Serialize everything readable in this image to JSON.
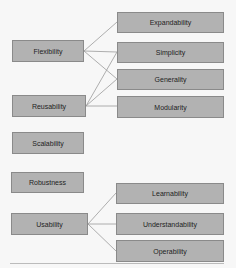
{
  "diagram": {
    "colors": {
      "box_fill": "#b2b2b2",
      "box_border": "#8a8a8a",
      "line": "#9a9a9a",
      "background": "#f7f7f7"
    },
    "left_nodes": [
      {
        "id": "flexibility",
        "label": "Flexibility"
      },
      {
        "id": "reusability",
        "label": "Reusability"
      },
      {
        "id": "scalability",
        "label": "Scalability"
      },
      {
        "id": "robustness",
        "label": "Robustness"
      },
      {
        "id": "usability",
        "label": "Usability"
      }
    ],
    "right_nodes": [
      {
        "id": "expandability",
        "label": "Expandability"
      },
      {
        "id": "simplicity",
        "label": "Simplicity"
      },
      {
        "id": "generality",
        "label": "Generality"
      },
      {
        "id": "modularity",
        "label": "Modularity"
      },
      {
        "id": "learnability",
        "label": "Learnability"
      },
      {
        "id": "understandability",
        "label": "Understandability"
      },
      {
        "id": "operability",
        "label": "Operability"
      }
    ],
    "edges": [
      [
        "Flexibility",
        "Expandability"
      ],
      [
        "Flexibility",
        "Simplicity"
      ],
      [
        "Flexibility",
        "Generality"
      ],
      [
        "Reusability",
        "Simplicity"
      ],
      [
        "Reusability",
        "Generality"
      ],
      [
        "Reusability",
        "Modularity"
      ],
      [
        "Usability",
        "Learnability"
      ],
      [
        "Usability",
        "Understandability"
      ],
      [
        "Usability",
        "Operability"
      ]
    ]
  }
}
